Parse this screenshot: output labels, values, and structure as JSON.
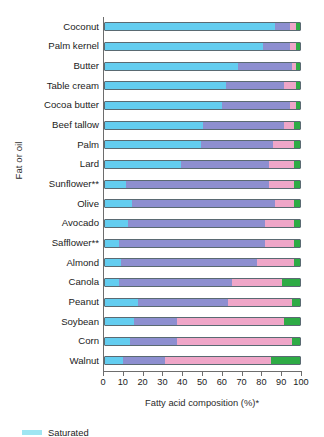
{
  "chart_data": {
    "type": "bar",
    "orientation": "horizontal",
    "stacked": true,
    "title": "",
    "xlabel": "Fatty acid composition (%)*",
    "ylabel": "Fat or oil",
    "xlim": [
      0,
      100
    ],
    "xticks": [
      0,
      10,
      20,
      30,
      40,
      50,
      60,
      70,
      80,
      90,
      100
    ],
    "grid": false,
    "legend_position": "bottom-left",
    "categories": [
      "Coconut",
      "Palm kernel",
      "Butter",
      "Table cream",
      "Cocoa butter",
      "Beef tallow",
      "Palm",
      "Lard",
      "Sunflower**",
      "Olive",
      "Avocado",
      "Safflower**",
      "Almond",
      "Canola",
      "Peanut",
      "Soybean",
      "Corn",
      "Walnut"
    ],
    "series": [
      {
        "name": "Saturated",
        "color": "#63cdf0",
        "values": [
          87,
          81,
          68,
          62,
          60,
          50,
          49,
          39,
          11,
          14,
          12,
          7,
          8,
          7,
          17,
          15,
          13,
          9
        ]
      },
      {
        "name": "Monounsaturated",
        "color": "#8d8fd0",
        "values": [
          8,
          14,
          28,
          30,
          35,
          42,
          37,
          45,
          73,
          73,
          70,
          75,
          70,
          58,
          46,
          22,
          24,
          22
        ]
      },
      {
        "name": "Polyunsaturated omega-6",
        "color": "#efa6c8",
        "values": [
          3,
          3,
          2,
          6,
          3,
          5,
          11,
          13,
          13,
          10,
          15,
          15,
          19,
          26,
          33,
          55,
          59,
          54
        ]
      },
      {
        "name": "Polyunsaturated omega-3",
        "color": "#2eab45",
        "values": [
          2,
          2,
          2,
          2,
          2,
          3,
          3,
          3,
          3,
          3,
          3,
          3,
          3,
          9,
          4,
          8,
          4,
          15
        ]
      }
    ]
  },
  "legend": {
    "items": [
      {
        "label": "Saturated",
        "color": "#9fe6f2"
      }
    ]
  }
}
